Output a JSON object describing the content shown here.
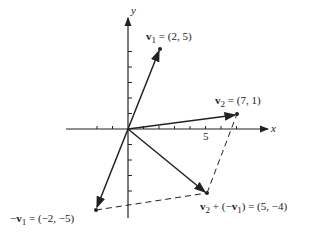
{
  "diagram": {
    "axes": {
      "x_label": "x",
      "y_label": "y",
      "tick_label_5": "5"
    },
    "vectors": [
      {
        "name": "v1",
        "label_name": "v",
        "label_sub": "1",
        "label_rest": " = (2, 5)",
        "point": [
          2,
          5
        ]
      },
      {
        "name": "v2",
        "label_name": "v",
        "label_sub": "2",
        "label_rest": " = (7, 1)",
        "point": [
          7,
          1
        ]
      },
      {
        "name": "neg-v1",
        "label_prefix": "−",
        "label_name": "v",
        "label_sub": "1",
        "label_rest": " = (−2, −5)",
        "point": [
          -2,
          -5
        ]
      },
      {
        "name": "v2-plus-neg-v1",
        "label_name": "v",
        "label_sub": "2",
        "label_mid": " + (−",
        "label_name2": "v",
        "label_sub2": "1",
        "label_rest": ") = (5, −4)",
        "point": [
          5,
          -4
        ]
      }
    ]
  }
}
